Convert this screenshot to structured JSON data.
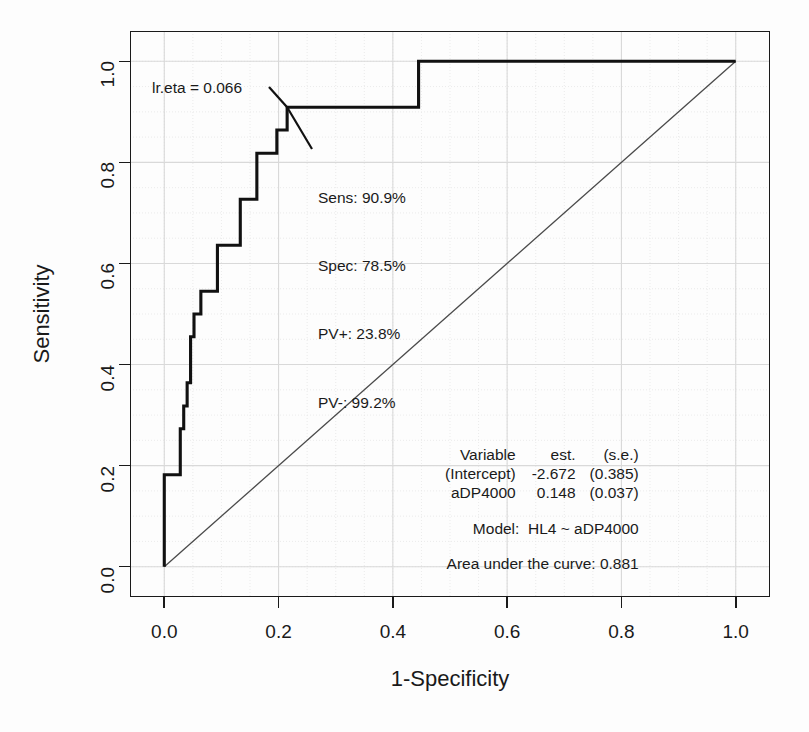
{
  "chart_data": {
    "type": "line",
    "title": "",
    "xlabel": "1-Specificity",
    "ylabel": "Sensitivity",
    "xlim": [
      -0.06,
      1.06
    ],
    "ylim": [
      -0.06,
      1.06
    ],
    "xticks": [
      "0.0",
      "0.2",
      "0.4",
      "0.6",
      "0.8",
      "1.0"
    ],
    "xtick_values": [
      0.0,
      0.2,
      0.4,
      0.6,
      0.8,
      1.0
    ],
    "yticks": [
      "0.0",
      "0.2",
      "0.4",
      "0.6",
      "0.8",
      "1.0"
    ],
    "ytick_values": [
      0.0,
      0.2,
      0.4,
      0.6,
      0.8,
      1.0
    ],
    "grid": true,
    "legend": "none",
    "series": [
      {
        "name": "ROC curve",
        "style": "step",
        "points": [
          [
            0.0,
            0.0
          ],
          [
            0.0,
            0.182
          ],
          [
            0.028,
            0.182
          ],
          [
            0.028,
            0.273
          ],
          [
            0.034,
            0.273
          ],
          [
            0.034,
            0.318
          ],
          [
            0.04,
            0.318
          ],
          [
            0.04,
            0.364
          ],
          [
            0.046,
            0.364
          ],
          [
            0.046,
            0.455
          ],
          [
            0.052,
            0.455
          ],
          [
            0.052,
            0.5
          ],
          [
            0.064,
            0.5
          ],
          [
            0.064,
            0.545
          ],
          [
            0.093,
            0.545
          ],
          [
            0.093,
            0.636
          ],
          [
            0.133,
            0.636
          ],
          [
            0.133,
            0.727
          ],
          [
            0.162,
            0.727
          ],
          [
            0.162,
            0.818
          ],
          [
            0.197,
            0.818
          ],
          [
            0.197,
            0.864
          ],
          [
            0.215,
            0.864
          ],
          [
            0.215,
            0.909
          ],
          [
            0.445,
            0.909
          ],
          [
            0.445,
            1.0
          ],
          [
            1.0,
            1.0
          ]
        ]
      },
      {
        "name": "chance diagonal",
        "style": "line",
        "points": [
          [
            0.0,
            0.0
          ],
          [
            1.0,
            1.0
          ]
        ]
      }
    ],
    "operating_point": {
      "x": 0.215,
      "y": 0.909
    },
    "annotations": {
      "cutoff_label": "lr.eta = 0.066",
      "metrics": [
        "Sens: 90.9%",
        "Spec: 78.5%",
        "PV+: 23.8%",
        "PV-: 99.2%"
      ],
      "model_table": {
        "headers": [
          "Variable",
          "est.",
          "(s.e.)"
        ],
        "rows": [
          [
            "(Intercept)",
            "-2.672",
            "(0.385)"
          ],
          [
            "aDP4000",
            "0.148",
            "(0.037)"
          ]
        ]
      },
      "model_line": "Model:  HL4 ~ aDP4000",
      "auc_line": "Area under the curve: 0.881"
    },
    "colors": {
      "curve": "#111111",
      "diagonal": "#4a4a4a",
      "grid": "#d9d9d9",
      "axis": "#1a1a1a",
      "background": "#fdfdfd"
    }
  }
}
